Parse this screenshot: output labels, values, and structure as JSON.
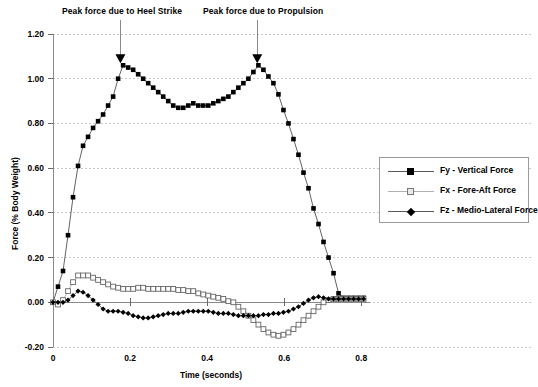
{
  "chart_data": {
    "type": "line",
    "title": "",
    "xlabel": "Time (seconds)",
    "ylabel": "Force (% Body Weight)",
    "xlim": [
      0,
      0.82
    ],
    "ylim": [
      -0.2,
      1.2
    ],
    "xticks": [
      "0",
      "0.2",
      "0.4",
      "0.6",
      "0.8"
    ],
    "xtick_values": [
      0,
      0.2,
      0.4,
      0.6,
      0.8
    ],
    "yticks": [
      "-0.20",
      "0.00",
      "0.20",
      "0.40",
      "0.60",
      "0.80",
      "1.00",
      "1.20"
    ],
    "ytick_values": [
      -0.2,
      0,
      0.2,
      0.4,
      0.6,
      0.8,
      1.0,
      1.2
    ],
    "grid": "horizontal-dashed",
    "legend_position": "right-outside",
    "annotations": [
      {
        "text": "Peak force due to Heel Strike",
        "arrow_x": 0.175,
        "arrow_y": 1.06,
        "label_x": 0.175,
        "label_y": 1.34
      },
      {
        "text": "Peak force due to Propulsion",
        "arrow_x": 0.53,
        "arrow_y": 1.06,
        "label_x": 0.53,
        "label_y": 1.34
      }
    ],
    "series": [
      {
        "name": "Fy - Vertical Force",
        "legend_label": "Fy - Vertical Force",
        "marker": "filled-square",
        "color": "#000000",
        "x": [
          0.0,
          0.013,
          0.026,
          0.039,
          0.052,
          0.065,
          0.078,
          0.091,
          0.104,
          0.117,
          0.13,
          0.143,
          0.156,
          0.169,
          0.182,
          0.195,
          0.208,
          0.221,
          0.234,
          0.247,
          0.26,
          0.273,
          0.286,
          0.299,
          0.312,
          0.325,
          0.338,
          0.351,
          0.364,
          0.377,
          0.39,
          0.403,
          0.416,
          0.429,
          0.442,
          0.455,
          0.468,
          0.481,
          0.494,
          0.507,
          0.52,
          0.533,
          0.546,
          0.559,
          0.572,
          0.585,
          0.598,
          0.611,
          0.624,
          0.637,
          0.65,
          0.663,
          0.676,
          0.689,
          0.702,
          0.715,
          0.728,
          0.741,
          0.754,
          0.767,
          0.78,
          0.793,
          0.806
        ],
        "y": [
          0.0,
          0.07,
          0.14,
          0.3,
          0.47,
          0.61,
          0.7,
          0.74,
          0.78,
          0.81,
          0.84,
          0.88,
          0.92,
          1.0,
          1.06,
          1.05,
          1.04,
          1.02,
          1.0,
          0.98,
          0.96,
          0.94,
          0.92,
          0.9,
          0.88,
          0.87,
          0.87,
          0.88,
          0.89,
          0.88,
          0.88,
          0.88,
          0.89,
          0.9,
          0.91,
          0.92,
          0.94,
          0.96,
          0.98,
          1.0,
          1.03,
          1.06,
          1.04,
          1.01,
          0.98,
          0.93,
          0.86,
          0.8,
          0.73,
          0.66,
          0.58,
          0.51,
          0.42,
          0.35,
          0.27,
          0.2,
          0.13,
          0.04,
          0.02,
          0.02,
          0.02,
          0.02,
          0.02
        ]
      },
      {
        "name": "Fx - Fore-Aft Force",
        "legend_label": "Fx - Fore-Aft Force",
        "marker": "open-square",
        "color": "#ffffff",
        "edge_color": "#666666",
        "x": [
          0.0,
          0.013,
          0.026,
          0.039,
          0.052,
          0.065,
          0.078,
          0.091,
          0.104,
          0.117,
          0.13,
          0.143,
          0.156,
          0.169,
          0.182,
          0.195,
          0.208,
          0.221,
          0.234,
          0.247,
          0.26,
          0.273,
          0.286,
          0.299,
          0.312,
          0.325,
          0.338,
          0.351,
          0.364,
          0.377,
          0.39,
          0.403,
          0.416,
          0.429,
          0.442,
          0.455,
          0.468,
          0.481,
          0.494,
          0.507,
          0.52,
          0.533,
          0.546,
          0.559,
          0.572,
          0.585,
          0.598,
          0.611,
          0.624,
          0.637,
          0.65,
          0.663,
          0.676,
          0.689,
          0.702,
          0.715,
          0.728,
          0.741,
          0.754,
          0.767,
          0.78,
          0.793,
          0.806
        ],
        "y": [
          0.0,
          -0.01,
          0.01,
          0.05,
          0.09,
          0.12,
          0.12,
          0.12,
          0.11,
          0.1,
          0.09,
          0.08,
          0.07,
          0.065,
          0.06,
          0.06,
          0.06,
          0.065,
          0.065,
          0.06,
          0.06,
          0.06,
          0.06,
          0.06,
          0.06,
          0.055,
          0.055,
          0.05,
          0.05,
          0.04,
          0.035,
          0.03,
          0.025,
          0.02,
          0.015,
          0.005,
          0.0,
          -0.02,
          -0.04,
          -0.06,
          -0.08,
          -0.1,
          -0.12,
          -0.135,
          -0.145,
          -0.15,
          -0.145,
          -0.135,
          -0.12,
          -0.1,
          -0.08,
          -0.06,
          -0.04,
          -0.02,
          0.0,
          0.01,
          0.015,
          0.015,
          0.015,
          0.015,
          0.015,
          0.015,
          0.015
        ]
      },
      {
        "name": "Fz - Medio-Lateral Force",
        "legend_label": "Fz - Medio-Lateral Force",
        "marker": "filled-diamond",
        "color": "#000000",
        "x": [
          0.0,
          0.013,
          0.026,
          0.039,
          0.052,
          0.065,
          0.078,
          0.091,
          0.104,
          0.117,
          0.13,
          0.143,
          0.156,
          0.169,
          0.182,
          0.195,
          0.208,
          0.221,
          0.234,
          0.247,
          0.26,
          0.273,
          0.286,
          0.299,
          0.312,
          0.325,
          0.338,
          0.351,
          0.364,
          0.377,
          0.39,
          0.403,
          0.416,
          0.429,
          0.442,
          0.455,
          0.468,
          0.481,
          0.494,
          0.507,
          0.52,
          0.533,
          0.546,
          0.559,
          0.572,
          0.585,
          0.598,
          0.611,
          0.624,
          0.637,
          0.65,
          0.663,
          0.676,
          0.689,
          0.702,
          0.715,
          0.728,
          0.741,
          0.754,
          0.767,
          0.78,
          0.793,
          0.806
        ],
        "y": [
          0.0,
          0.0,
          0.0,
          0.01,
          0.03,
          0.05,
          0.045,
          0.03,
          0.01,
          -0.01,
          -0.03,
          -0.04,
          -0.04,
          -0.04,
          -0.045,
          -0.05,
          -0.06,
          -0.065,
          -0.07,
          -0.07,
          -0.065,
          -0.06,
          -0.055,
          -0.05,
          -0.05,
          -0.05,
          -0.045,
          -0.04,
          -0.04,
          -0.04,
          -0.04,
          -0.04,
          -0.045,
          -0.05,
          -0.05,
          -0.05,
          -0.055,
          -0.06,
          -0.06,
          -0.06,
          -0.06,
          -0.06,
          -0.055,
          -0.055,
          -0.05,
          -0.05,
          -0.045,
          -0.04,
          -0.03,
          -0.02,
          -0.005,
          0.01,
          0.02,
          0.025,
          0.02,
          0.015,
          0.015,
          0.015,
          0.015,
          0.015,
          0.015,
          0.015,
          0.015
        ]
      }
    ]
  },
  "axis": {
    "ylabel": "Force (% Body Weight)",
    "xlabel": "Time (seconds)"
  },
  "legend": {
    "items": [
      {
        "label": "Fy - Vertical Force"
      },
      {
        "label": "Fx - Fore-Aft Force"
      },
      {
        "label": "Fz - Medio-Lateral Force"
      }
    ]
  }
}
